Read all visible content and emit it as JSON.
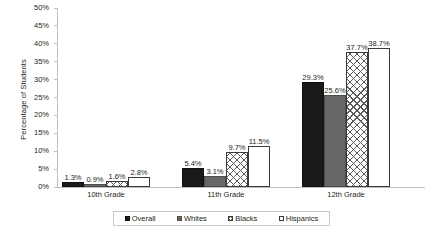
{
  "chart_data": {
    "type": "bar",
    "title": "",
    "xlabel": "",
    "ylabel": "Percentage of Students",
    "categories": [
      "10th Grade",
      "11th Grade",
      "12th Grade"
    ],
    "series": [
      {
        "name": "Overall",
        "values": [
          1.3,
          5.4,
          29.3
        ],
        "labels": [
          "1.3%",
          "5.4%",
          "29.3%"
        ],
        "color": "#1a1a1a",
        "fill": "solid-black"
      },
      {
        "name": "Whites",
        "values": [
          0.9,
          3.1,
          25.6
        ],
        "labels": [
          "0.9%",
          "3.1%",
          "25.6%"
        ],
        "color": "#676767",
        "fill": "solid-gray"
      },
      {
        "name": "Blacks",
        "values": [
          1.6,
          9.7,
          37.7
        ],
        "labels": [
          "1.6%",
          "9.7%",
          "37.7%"
        ],
        "color": "#ffffff",
        "fill": "cross-hatch"
      },
      {
        "name": "Hispanics",
        "values": [
          2.8,
          11.5,
          38.7
        ],
        "labels": [
          "2.8%",
          "11.5%",
          "38.7%"
        ],
        "color": "#ffffff",
        "fill": "solid-white"
      }
    ],
    "ylim": [
      0,
      50
    ],
    "yticks": [
      50,
      45,
      40,
      35,
      30,
      25,
      20,
      15,
      10,
      5,
      0
    ],
    "ytick_labels": [
      "50%",
      "45%",
      "40%",
      "35%",
      "30%",
      "25%",
      "20%",
      "15%",
      "10%",
      "5%",
      "0%"
    ],
    "grid": false,
    "legend_position": "bottom"
  },
  "legend": {
    "items": [
      {
        "label": "Overall"
      },
      {
        "label": "Whites"
      },
      {
        "label": "Blacks"
      },
      {
        "label": "Hispanics"
      }
    ]
  }
}
